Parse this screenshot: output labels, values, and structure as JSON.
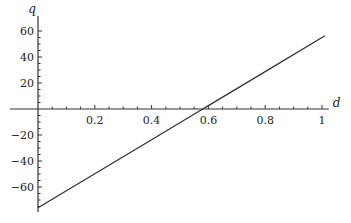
{
  "chart_data": {
    "type": "line",
    "title": "",
    "xlabel": "d",
    "ylabel": "q",
    "xlim": [
      0,
      1.01
    ],
    "ylim": [
      -76,
      63
    ],
    "grid": false,
    "legend": null,
    "x_ticks": [
      0.2,
      0.4,
      0.6,
      0.8,
      1
    ],
    "x_tick_labels": [
      "0.2",
      "0.4",
      "0.6",
      "0.8",
      "1"
    ],
    "y_ticks": [
      60,
      40,
      20,
      -20,
      -40,
      -60
    ],
    "y_tick_labels": [
      "60",
      "40",
      "20",
      "−20",
      "−40",
      "−60"
    ],
    "series": [
      {
        "name": "q(d)",
        "color": "#333333",
        "x": [
          0,
          0.2,
          0.4,
          0.58,
          0.6,
          0.8,
          1.0,
          1.01
        ],
        "y": [
          -76,
          -49.8,
          -23.6,
          0,
          2.6,
          28.8,
          55,
          56.3
        ]
      }
    ]
  }
}
